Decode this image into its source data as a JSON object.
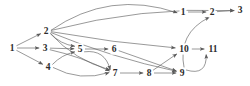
{
  "diagram": {
    "type": "directed-graph",
    "title": "",
    "background_color": "#ffffff",
    "edge_color": "#5a5a5a",
    "label_color": "#2b2b2b",
    "nodes": [
      {
        "id": "n1",
        "label": "1",
        "x": 12,
        "y": 48
      },
      {
        "id": "n2",
        "label": "2",
        "x": 46,
        "y": 31
      },
      {
        "id": "n3",
        "label": "3",
        "x": 45,
        "y": 48
      },
      {
        "id": "n4",
        "label": "4",
        "x": 48,
        "y": 67
      },
      {
        "id": "n5",
        "label": "5",
        "x": 80,
        "y": 49
      },
      {
        "id": "n6",
        "label": "6",
        "x": 114,
        "y": 49
      },
      {
        "id": "n7",
        "label": "7",
        "x": 115,
        "y": 73
      },
      {
        "id": "n8",
        "label": "8",
        "x": 149,
        "y": 73
      },
      {
        "id": "n9",
        "label": "9",
        "x": 182,
        "y": 73
      },
      {
        "id": "n10",
        "label": "10",
        "x": 184,
        "y": 49
      },
      {
        "id": "n11",
        "label": "11",
        "x": 213,
        "y": 49
      },
      {
        "id": "t1",
        "label": "1",
        "x": 183,
        "y": 12
      },
      {
        "id": "t2",
        "label": "2",
        "x": 212,
        "y": 12
      },
      {
        "id": "t3",
        "label": "3",
        "x": 240,
        "y": 10
      }
    ],
    "edges": [
      {
        "from": "n1",
        "to": "n2"
      },
      {
        "from": "n1",
        "to": "n3"
      },
      {
        "from": "n1",
        "to": "n4"
      },
      {
        "from": "n2",
        "to": "t1"
      },
      {
        "from": "n2",
        "to": "n5"
      },
      {
        "from": "n2",
        "to": "n7"
      },
      {
        "from": "n2",
        "to": "n9"
      },
      {
        "from": "n2",
        "to": "n10"
      },
      {
        "from": "n2",
        "to": "t3"
      },
      {
        "from": "n3",
        "to": "n5"
      },
      {
        "from": "n3",
        "to": "n7"
      },
      {
        "from": "n4",
        "to": "n5"
      },
      {
        "from": "n4",
        "to": "n7"
      },
      {
        "from": "n5",
        "to": "n6"
      },
      {
        "from": "n5",
        "to": "n7"
      },
      {
        "from": "n6",
        "to": "n9"
      },
      {
        "from": "n7",
        "to": "n8"
      },
      {
        "from": "n8",
        "to": "n9"
      },
      {
        "from": "n8",
        "to": "n10"
      },
      {
        "from": "n9",
        "to": "t2"
      },
      {
        "from": "n9",
        "to": "n11"
      },
      {
        "from": "n10",
        "to": "n11"
      },
      {
        "from": "t1",
        "to": "t2"
      },
      {
        "from": "t2",
        "to": "t3"
      }
    ]
  }
}
